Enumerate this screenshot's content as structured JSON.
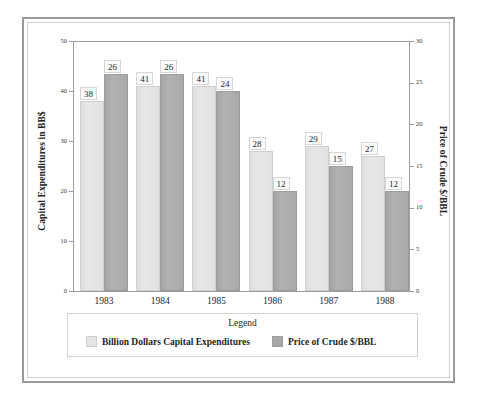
{
  "chart_data": {
    "type": "bar",
    "title": "",
    "subtitle": "",
    "xlabel": "",
    "ylabel": "Capital Expenditures in BB$",
    "y2label": "Price of Crude $/BBL",
    "categories": [
      "1983",
      "1984",
      "1985",
      "1986",
      "1987",
      "1988"
    ],
    "series": [
      {
        "name": "Billion Dollars Capital Expenditures",
        "axis": "left",
        "color": "#e2e2e2",
        "values": [
          38,
          41,
          41,
          28,
          29,
          27
        ]
      },
      {
        "name": "Price of Crude $/BBL",
        "axis": "right",
        "color": "#a9a9a9",
        "values": [
          26,
          26,
          24,
          12,
          15,
          12
        ]
      }
    ],
    "ylim": [
      0,
      50
    ],
    "yticks": [
      0,
      10,
      20,
      30,
      40,
      50
    ],
    "y2lim": [
      0,
      30
    ],
    "y2ticks": [
      0,
      5,
      10,
      15,
      20,
      25,
      30
    ],
    "grid": false,
    "legend_position": "bottom",
    "legend_title": "Legend",
    "data_labels": true
  },
  "legend": {
    "title": "Legend",
    "entries": [
      {
        "label": "Billion Dollars Capital Expenditures",
        "swatch": "light-gray-swatch"
      },
      {
        "label": "Price of Crude $/BBL",
        "swatch": "dark-gray-swatch"
      }
    ]
  },
  "colors": {
    "series_a": "#e2e2e2",
    "series_b": "#a9a9a9",
    "frame": "#9a9a9a",
    "axis": "#9d9d9d",
    "background": "#ffffff"
  }
}
